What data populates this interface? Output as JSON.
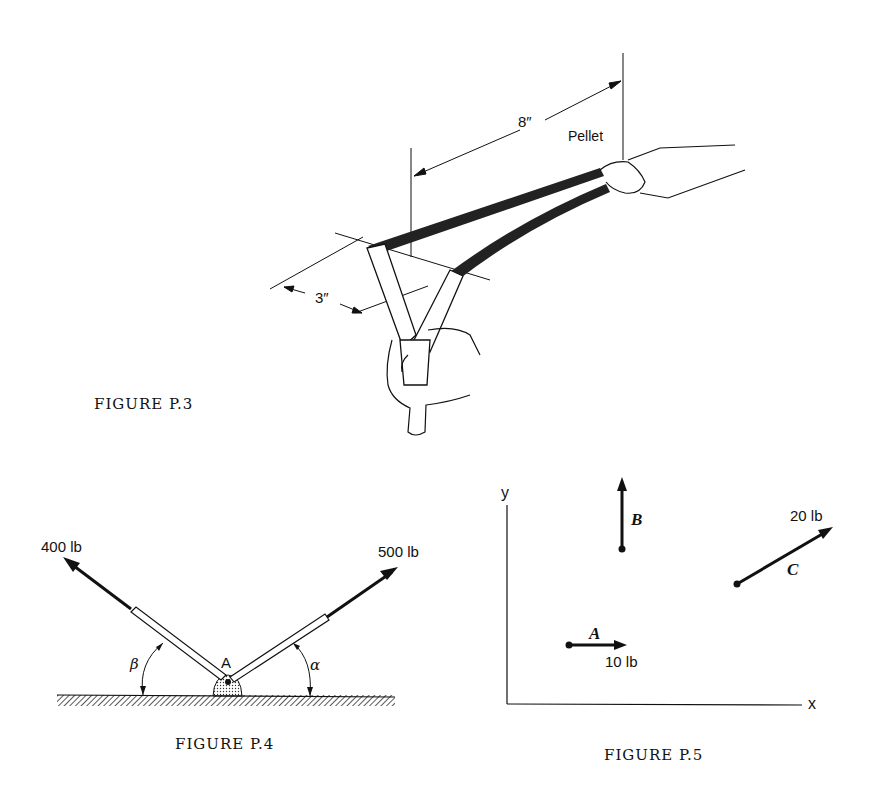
{
  "figures": {
    "p3": {
      "caption": "FIGURE P.3",
      "dim_long": "8″",
      "dim_short": "3″",
      "pellet_label": "Pellet"
    },
    "p4": {
      "caption": "FIGURE P.4",
      "force_left": "400 lb",
      "force_right": "500 lb",
      "point_label": "A",
      "angle_left": "β",
      "angle_right": "α"
    },
    "p5": {
      "caption": "FIGURE P.5",
      "axis_x": "x",
      "axis_y": "y",
      "vector_a_label": "A",
      "vector_a_value": "10 lb",
      "vector_b_label": "B",
      "vector_c_label": "C",
      "vector_c_value": "20 lb"
    }
  }
}
